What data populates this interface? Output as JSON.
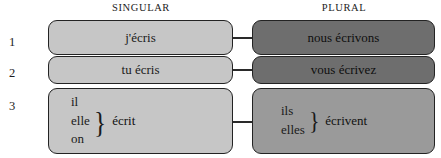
{
  "headers": {
    "singular": "SINGULAR",
    "plural": "PLURAL"
  },
  "rows": [
    {
      "number": "1",
      "singular": {
        "text": "j'écris"
      },
      "plural": {
        "text": "nous écrivons"
      }
    },
    {
      "number": "2",
      "singular": {
        "text": "tu écris"
      },
      "plural": {
        "text": "vous écrivez"
      }
    },
    {
      "number": "3",
      "singular": {
        "pronouns": [
          "il",
          "elle",
          "on"
        ],
        "brace": "}",
        "verb": "écrit"
      },
      "plural": {
        "pronouns": [
          "ils",
          "elles"
        ],
        "brace": "}",
        "verb": "écrivent"
      }
    }
  ],
  "colors": {
    "singular_box_fill": "#c6c6c6",
    "plural_box_fill_dark": "#6e6e6e",
    "plural_box_fill_medium": "#9a9a9a",
    "box_border": "#232323",
    "connector": "#2a2a2a",
    "page_background": "#ffffff",
    "text": "#1a1a1a"
  }
}
